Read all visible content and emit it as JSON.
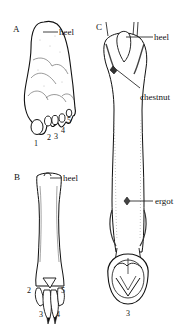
{
  "figure": {
    "panels": [
      {
        "id": "A",
        "letter": "A",
        "subject": "plantigrade-foot",
        "labels": {
          "heel": "heel"
        },
        "digits": [
          "1",
          "2",
          "3",
          "4",
          "5"
        ]
      },
      {
        "id": "B",
        "letter": "B",
        "subject": "digitigrade-foot",
        "labels": {
          "heel": "heel"
        },
        "digits": [
          "2",
          "3",
          "4",
          "5"
        ]
      },
      {
        "id": "C",
        "letter": "C",
        "subject": "unguligrade-foot",
        "labels": {
          "heel": "heel",
          "chestnut": "chestnut",
          "ergot": "ergot"
        },
        "digits": [
          "3"
        ]
      }
    ],
    "colors": {
      "ink": "#111111",
      "background": "#ffffff",
      "shade": "#cfcfcf"
    }
  }
}
